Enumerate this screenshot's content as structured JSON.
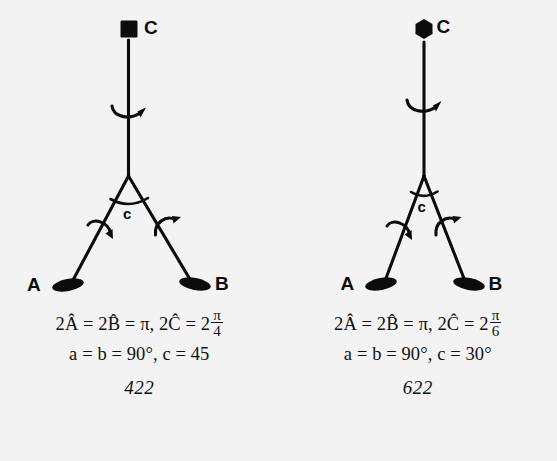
{
  "figure": {
    "background_color": "#f4f3f4",
    "ink_color": "#0c0c0c",
    "panels": [
      {
        "id": "left",
        "group_label": "422",
        "principal_axis": {
          "symbol_icon": "square-4fold-axis-icon",
          "label": "C",
          "fold": 4
        },
        "secondary_axes": [
          {
            "label": "A",
            "symbol_icon": "lens-2fold-axis-icon",
            "fold": 2
          },
          {
            "label": "B",
            "symbol_icon": "lens-2fold-axis-icon",
            "fold": 2
          }
        ],
        "angle_label": "c",
        "rotation_arrows": [
          "rotation-arrow-icon-principal",
          "rotation-arrow-icon-left-leg",
          "rotation-arrow-icon-right-leg"
        ],
        "formula_line1": {
          "prefix": "2Â = 2B̂ = π,  2Ĉ = 2",
          "numerator": "π",
          "denominator": "4"
        },
        "formula_line2": "a = b = 90°,  c = 45",
        "values": {
          "A_hat_doubled": "π",
          "B_hat_doubled": "π",
          "C_hat_doubled": "2π/4",
          "a": "90°",
          "b": "90°",
          "c": "45"
        }
      },
      {
        "id": "right",
        "group_label": "622",
        "principal_axis": {
          "symbol_icon": "hexagon-6fold-axis-icon",
          "label": "C",
          "fold": 6
        },
        "secondary_axes": [
          {
            "label": "A",
            "symbol_icon": "lens-2fold-axis-icon",
            "fold": 2
          },
          {
            "label": "B",
            "symbol_icon": "lens-2fold-axis-icon",
            "fold": 2
          }
        ],
        "angle_label": "c",
        "rotation_arrows": [
          "rotation-arrow-icon-principal",
          "rotation-arrow-icon-left-leg",
          "rotation-arrow-icon-right-leg"
        ],
        "formula_line1": {
          "prefix": "2Â = 2B̂ = π,  2Ĉ = 2",
          "numerator": "π",
          "denominator": "6"
        },
        "formula_line2": "a = b = 90°,  c = 30°",
        "values": {
          "A_hat_doubled": "π",
          "B_hat_doubled": "π",
          "C_hat_doubled": "2π/6",
          "a": "90°",
          "b": "90°",
          "c": "30°"
        }
      }
    ]
  }
}
